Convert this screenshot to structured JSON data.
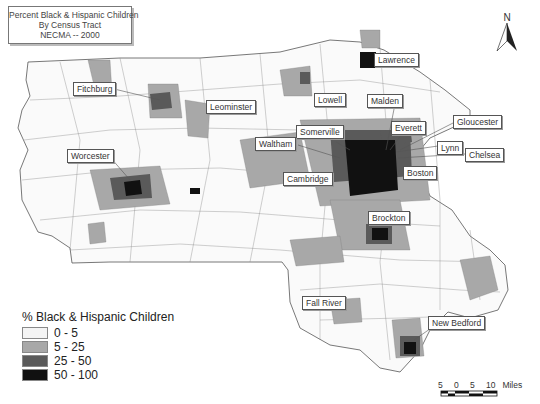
{
  "title": {
    "line1": "Percent Black & Hispanic Children",
    "line2": "By Census Tract",
    "line3": "NECMA -- 2000"
  },
  "north_arrow": {
    "label": "N"
  },
  "cities": [
    {
      "name": "Lawrence",
      "x": 374,
      "y": 53
    },
    {
      "name": "Fitchburg",
      "x": 73,
      "y": 82
    },
    {
      "name": "Leominster",
      "x": 206,
      "y": 100
    },
    {
      "name": "Lowell",
      "x": 314,
      "y": 93
    },
    {
      "name": "Malden",
      "x": 367,
      "y": 94
    },
    {
      "name": "Everett",
      "x": 391,
      "y": 121
    },
    {
      "name": "Gloucester",
      "x": 453,
      "y": 115
    },
    {
      "name": "Somerville",
      "x": 296,
      "y": 125
    },
    {
      "name": "Waltham",
      "x": 255,
      "y": 137
    },
    {
      "name": "Lynn",
      "x": 437,
      "y": 141
    },
    {
      "name": "Chelsea",
      "x": 465,
      "y": 148
    },
    {
      "name": "Worcester",
      "x": 67,
      "y": 149
    },
    {
      "name": "Cambridge",
      "x": 283,
      "y": 172
    },
    {
      "name": "Boston",
      "x": 403,
      "y": 166
    },
    {
      "name": "Brockton",
      "x": 368,
      "y": 211
    },
    {
      "name": "Fall River",
      "x": 302,
      "y": 296
    },
    {
      "name": "New Bedford",
      "x": 428,
      "y": 316
    }
  ],
  "legend": {
    "title": "% Black & Hispanic Children",
    "items": [
      {
        "label": "0 - 5",
        "color": "#f4f4f4"
      },
      {
        "label": "5 - 25",
        "color": "#a8a8a8"
      },
      {
        "label": "25 - 50",
        "color": "#5a5a5a"
      },
      {
        "label": "50 - 100",
        "color": "#111111"
      }
    ]
  },
  "scale_bar": {
    "ticks": [
      "5",
      "0",
      "5",
      "10"
    ],
    "unit": "Miles"
  }
}
